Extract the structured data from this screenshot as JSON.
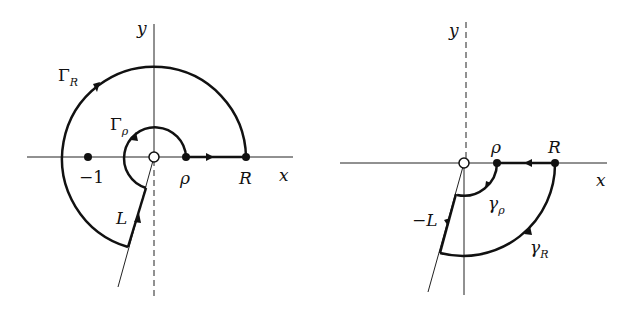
{
  "left_diagram": {
    "axis_x_label": "x",
    "axis_y_label": "y",
    "big_arc_label": "Γ",
    "big_arc_sub": "R",
    "small_arc_label": "Γ",
    "small_arc_sub": "ρ",
    "point_minus_one": "−1",
    "point_rho": "ρ",
    "point_R": "R",
    "ray_label": "L"
  },
  "right_diagram": {
    "axis_x_label": "x",
    "axis_y_label": "y",
    "point_rho": "ρ",
    "point_R": "R",
    "ray_label": "−L",
    "small_arc_label": "γ",
    "small_arc_sub": "ρ",
    "big_arc_label": "γ",
    "big_arc_sub": "R"
  }
}
